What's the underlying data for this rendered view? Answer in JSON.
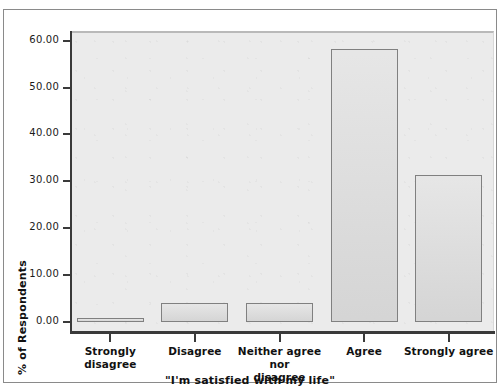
{
  "chart_data": {
    "type": "bar",
    "title": "",
    "xlabel": "\"I'm satisfied with my life\"",
    "ylabel": "% of Respondents",
    "categories": [
      "Strongly disagree",
      "Disagree",
      "Neither agree nor disagree",
      "Agree",
      "Strongly agree"
    ],
    "values": [
      0.8,
      4.1,
      4.1,
      58.2,
      31.4
    ],
    "ylim": [
      0,
      64
    ],
    "yticks": [
      0,
      10,
      20,
      30,
      40,
      50,
      60
    ],
    "ytick_labels": [
      "0.00",
      "10.00",
      "20.00",
      "30.00",
      "40.00",
      "50.00",
      "60.00"
    ],
    "grid": false,
    "legend": null,
    "bar_fill_color": "#d9d9d9",
    "bar_border_color": "#808080",
    "plot_background_color": "#ebebeb",
    "axis_color": "#3a3a3a"
  },
  "category_label_lines": [
    [
      "Strongly disagree"
    ],
    [
      "Disagree"
    ],
    [
      "Neither agree nor",
      "disagree"
    ],
    [
      "Agree"
    ],
    [
      "Strongly agree"
    ]
  ]
}
